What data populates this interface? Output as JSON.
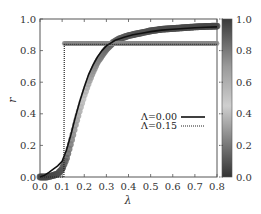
{
  "chart_data": {
    "type": "line",
    "title": "",
    "xlabel": "λ",
    "ylabel": "r",
    "xlim": [
      0.0,
      0.8
    ],
    "ylim": [
      0.0,
      1.0
    ],
    "xticks": [
      "0.0",
      "0.1",
      "0.2",
      "0.3",
      "0.4",
      "0.5",
      "0.6",
      "0.7",
      "0.8"
    ],
    "yticks": [
      "0.0",
      "0.2",
      "0.4",
      "0.6",
      "0.8",
      "1.0"
    ],
    "colorbar": {
      "ticks": [
        "0.0",
        "0.2",
        "0.4",
        "0.6",
        "0.8",
        "1.0"
      ],
      "range": [
        0.0,
        1.0
      ],
      "colormap": "grayscale dark-light-dark"
    },
    "legend": {
      "position": "center-right",
      "entries": [
        {
          "label": "Λ=0.00",
          "style": "solid"
        },
        {
          "label": "Λ=0.15",
          "style": "dotted"
        }
      ]
    },
    "series": [
      {
        "name": "Λ=0.00",
        "style": "solid",
        "color": "#111111",
        "x": [
          0.0,
          0.02,
          0.04,
          0.06,
          0.08,
          0.1,
          0.12,
          0.14,
          0.16,
          0.18,
          0.2,
          0.22,
          0.24,
          0.26,
          0.28,
          0.3,
          0.34,
          0.38,
          0.42,
          0.46,
          0.5,
          0.55,
          0.6,
          0.65,
          0.7,
          0.75,
          0.8
        ],
        "y": [
          0.0,
          0.01,
          0.03,
          0.05,
          0.07,
          0.1,
          0.17,
          0.27,
          0.38,
          0.48,
          0.57,
          0.65,
          0.71,
          0.76,
          0.8,
          0.83,
          0.865,
          0.885,
          0.9,
          0.91,
          0.92,
          0.93,
          0.935,
          0.94,
          0.945,
          0.948,
          0.95
        ]
      },
      {
        "name": "Λ=0.15",
        "style": "dotted",
        "color": "#222222",
        "x": [
          0.0,
          0.05,
          0.1,
          0.108,
          0.11,
          0.12,
          0.2,
          0.3,
          0.4,
          0.5,
          0.6,
          0.7,
          0.8
        ],
        "y": [
          0.0,
          0.0,
          0.0,
          0.0,
          0.84,
          0.84,
          0.84,
          0.84,
          0.84,
          0.84,
          0.84,
          0.84,
          0.84
        ]
      },
      {
        "name": "simulation-band-Λ0",
        "style": "markers",
        "color": "#888888",
        "x": [
          0.0,
          0.03,
          0.06,
          0.08,
          0.1,
          0.12,
          0.14,
          0.16,
          0.18,
          0.2,
          0.22,
          0.24,
          0.26,
          0.28,
          0.3,
          0.33,
          0.36,
          0.4,
          0.45,
          0.5,
          0.55,
          0.6,
          0.65,
          0.7,
          0.75,
          0.8
        ],
        "y": [
          0.0,
          0.0,
          0.01,
          0.02,
          0.05,
          0.12,
          0.22,
          0.33,
          0.43,
          0.52,
          0.6,
          0.67,
          0.73,
          0.77,
          0.81,
          0.85,
          0.875,
          0.895,
          0.91,
          0.925,
          0.935,
          0.94,
          0.945,
          0.95,
          0.953,
          0.955
        ]
      },
      {
        "name": "simulation-band-Λ0.15",
        "style": "markers",
        "color": "#999999",
        "x": [
          0.11,
          0.15,
          0.2,
          0.25,
          0.3,
          0.35,
          0.4,
          0.45,
          0.5,
          0.55,
          0.6,
          0.65,
          0.7,
          0.75,
          0.8
        ],
        "y": [
          0.845,
          0.845,
          0.845,
          0.845,
          0.845,
          0.845,
          0.845,
          0.845,
          0.845,
          0.845,
          0.845,
          0.845,
          0.845,
          0.845,
          0.845
        ]
      }
    ]
  }
}
